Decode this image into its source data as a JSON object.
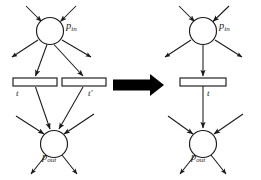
{
  "figure": {
    "background_color": "#ffffff",
    "stroke_color": "#1a1a1a",
    "arrow_color": "#000000"
  },
  "transform_arrow": {
    "name": "implies-arrow",
    "direction": "right",
    "glyph": "➡"
  },
  "left_panel": {
    "name": "before-net",
    "places": [
      {
        "id": "p_in",
        "label_base": "p",
        "label_sub": "in",
        "cx": 50,
        "cy": 31,
        "r": 13.5
      },
      {
        "id": "p_out",
        "label_base": "p",
        "label_sub": "out",
        "cx": 54,
        "cy": 144,
        "r": 13.5
      }
    ],
    "transitions": [
      {
        "id": "t",
        "label_base": "t",
        "label_sub": "",
        "x": 13,
        "y": 78,
        "w": 44,
        "h": 8
      },
      {
        "id": "t_prime",
        "label_base": "t",
        "label_sub": "′",
        "x": 62,
        "y": 78,
        "w": 44,
        "h": 8
      }
    ]
  },
  "right_panel": {
    "name": "after-net",
    "places": [
      {
        "id": "p_in",
        "label_base": "p",
        "label_sub": "in",
        "cx": 203,
        "cy": 31,
        "r": 13.5
      },
      {
        "id": "p_out",
        "label_base": "p",
        "label_sub": "out",
        "cx": 203,
        "cy": 144,
        "r": 13.5
      }
    ],
    "transitions": [
      {
        "id": "t",
        "label_base": "t",
        "label_sub": "",
        "x": 180,
        "y": 78,
        "w": 46,
        "h": 8
      }
    ]
  },
  "labels": {
    "p_in": "p",
    "p_in_sub": "in",
    "p_out": "p",
    "p_out_sub": "out",
    "t": "t",
    "t_prime": "t",
    "t_prime_sub": "′",
    "t_right": "t"
  }
}
